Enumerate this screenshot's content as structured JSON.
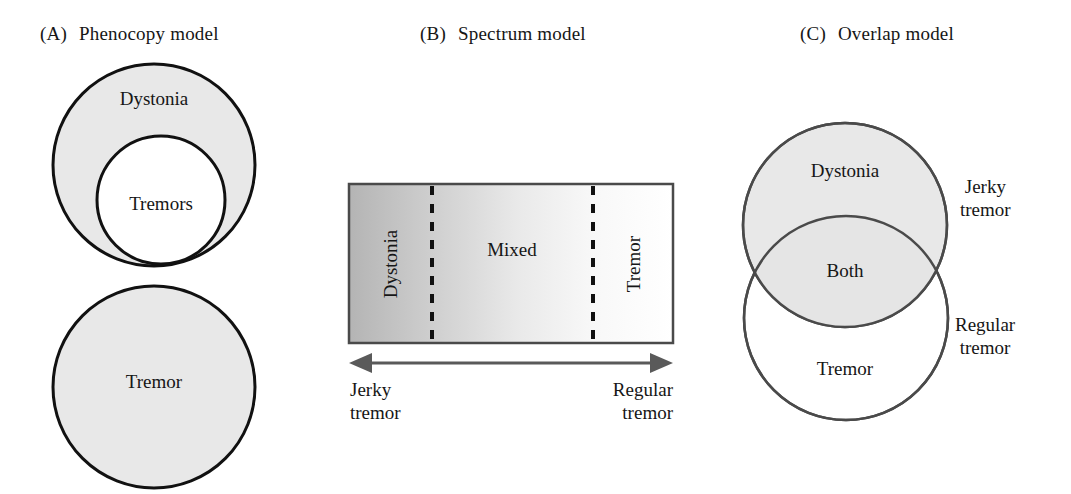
{
  "figure": {
    "background_color": "#ffffff",
    "text_color": "#161616"
  },
  "panels": [
    {
      "id": "phenocopy",
      "tag": "(A)",
      "title": "Phenocopy model",
      "labels": {
        "outer_circle": "Dystonia",
        "inner_circle": "Tremors",
        "second_circle": "Tremor"
      },
      "colors": {
        "fill_gray": "#e8e8e8",
        "fill_white": "#ffffff",
        "stroke": "#111111"
      }
    },
    {
      "id": "spectrum",
      "tag": "(B)",
      "title": "Spectrum model",
      "labels": {
        "left_band": "Dystonia",
        "middle_band": "Mixed",
        "right_band": "Tremor",
        "arrow_left_line1": "Jerky",
        "arrow_left_line2": "tremor",
        "arrow_right_line1": "Regular",
        "arrow_right_line2": "tremor"
      },
      "colors": {
        "gradient_start": "#b6b6b6",
        "gradient_end": "#ffffff",
        "stroke": "#4a4a4a",
        "divider": "#111111",
        "arrow": "#5a5a5a"
      }
    },
    {
      "id": "overlap",
      "tag": "(C)",
      "title": "Overlap model",
      "labels": {
        "top_circle": "Dystonia",
        "intersection": "Both",
        "bottom_circle": "Tremor",
        "side_top_line1": "Jerky",
        "side_top_line2": "tremor",
        "side_bottom_line1": "Regular",
        "side_bottom_line2": "tremor"
      },
      "colors": {
        "fill_gray": "#e8e8e8",
        "fill_white": "#ffffff",
        "stroke": "#4a4a4a"
      }
    }
  ]
}
